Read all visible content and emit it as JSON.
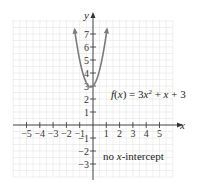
{
  "chart_data": {
    "type": "line",
    "title": "",
    "xlabel": "x",
    "ylabel": "y",
    "xlim": [
      -6,
      6
    ],
    "ylim": [
      -4,
      8
    ],
    "grid": true,
    "x_ticks": [
      -5,
      -4,
      -3,
      -2,
      -1,
      1,
      2,
      3,
      4,
      5
    ],
    "x_tick_labels": [
      "−5",
      "−4",
      "−3",
      "−2",
      "−1",
      "1",
      "2",
      "3",
      "4",
      "5"
    ],
    "y_ticks": [
      -3,
      -2,
      -1,
      1,
      2,
      3,
      4,
      5,
      6,
      7
    ],
    "y_tick_labels": [
      "−3",
      "−2",
      "−1",
      "1",
      "2",
      "3",
      "4",
      "5",
      "6",
      "7"
    ],
    "series": [
      {
        "name": "f(x) = 3x^2 + x + 3",
        "function": "3x^2 + x + 3",
        "color": "#7a7a7a",
        "x": [
          -1.5,
          -1.25,
          -1.0,
          -0.75,
          -0.5,
          -0.25,
          -0.1667,
          0.0,
          0.25,
          0.5,
          0.75,
          1.0,
          1.25
        ],
        "y": [
          8.25,
          6.44,
          5.0,
          3.94,
          3.25,
          2.94,
          2.92,
          3.0,
          3.44,
          4.25,
          5.44,
          7.0,
          8.94
        ]
      }
    ],
    "annotations": [
      {
        "text": "f(x) = 3x² + x + 3",
        "x": 1.0,
        "y": 2.5
      },
      {
        "text": "no x-intercept",
        "x": 1.0,
        "y": -2.1
      }
    ]
  },
  "labels": {
    "x_axis": "x",
    "y_axis": "y",
    "equation_prefix": "f(x) = 3x",
    "equation_exp": "2",
    "equation_suffix": " + x + 3",
    "note_prefix": "no ",
    "note_var": "x",
    "note_suffix": "-intercept"
  },
  "colors": {
    "grid": "#e4e4e4",
    "axis": "#333333",
    "curve": "#7a7a7a",
    "text": "#222222"
  }
}
